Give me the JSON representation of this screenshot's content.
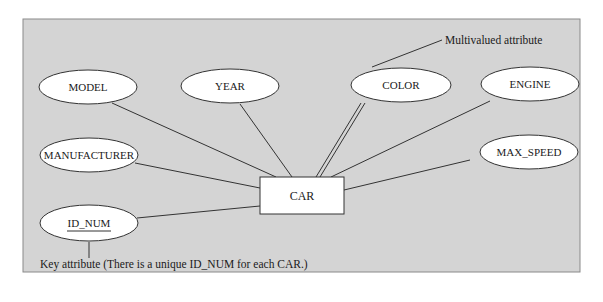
{
  "diagram": {
    "type": "ER diagram",
    "panel_color": "#d4d4d4",
    "entity": {
      "name": "CAR"
    },
    "attributes": [
      {
        "name": "MODEL",
        "kind": "simple"
      },
      {
        "name": "YEAR",
        "kind": "simple"
      },
      {
        "name": "COLOR",
        "kind": "multivalued"
      },
      {
        "name": "ENGINE",
        "kind": "simple"
      },
      {
        "name": "MANUFACTURER",
        "kind": "simple"
      },
      {
        "name": "MAX_SPEED",
        "kind": "simple"
      },
      {
        "name": "ID_NUM",
        "kind": "key"
      }
    ],
    "annotations": {
      "multivalued": "Multivalued attribute",
      "key": "Key attribute (There is a unique ID_NUM for each CAR.)"
    }
  }
}
